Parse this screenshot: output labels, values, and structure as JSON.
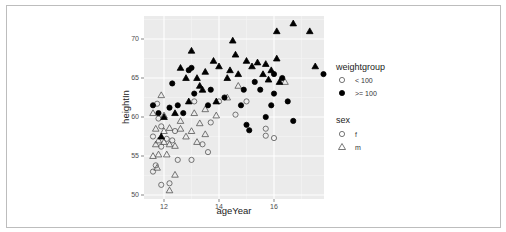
{
  "chart_data": {
    "type": "scatter",
    "title": "",
    "xlabel": "ageYear",
    "ylabel": "heightIn",
    "xlim": [
      11.3,
      17.8
    ],
    "ylim": [
      49.5,
      72.8
    ],
    "x_ticks": [
      12,
      14,
      16
    ],
    "y_ticks": [
      50,
      55,
      60,
      65,
      70
    ],
    "grid": true,
    "legend_position": "right",
    "legends": [
      {
        "title": "weightgroup",
        "aesthetic": "fill",
        "entries": [
          {
            "label": "< 100",
            "fill": "#ffffff"
          },
          {
            "label": ">= 100",
            "fill": "#000000"
          }
        ]
      },
      {
        "title": "sex",
        "aesthetic": "shape",
        "entries": [
          {
            "label": "f",
            "shape": "circle"
          },
          {
            "label": "m",
            "shape": "triangle"
          }
        ]
      }
    ],
    "points": [
      {
        "x": 11.6,
        "y": 53,
        "w": "<100",
        "s": "f"
      },
      {
        "x": 11.7,
        "y": 53.8,
        "w": "<100",
        "s": "f"
      },
      {
        "x": 11.75,
        "y": 53.5,
        "w": "<100",
        "s": "m"
      },
      {
        "x": 11.9,
        "y": 51.3,
        "w": "<100",
        "s": "f"
      },
      {
        "x": 12.2,
        "y": 51.5,
        "w": "<100",
        "s": "f"
      },
      {
        "x": 12.2,
        "y": 50.6,
        "w": "<100",
        "s": "m"
      },
      {
        "x": 12.4,
        "y": 52.6,
        "w": "<100",
        "s": "m"
      },
      {
        "x": 12.5,
        "y": 54.5,
        "w": "<100",
        "s": "f"
      },
      {
        "x": 13.0,
        "y": 54.5,
        "w": "<100",
        "s": "f"
      },
      {
        "x": 11.6,
        "y": 55,
        "w": "<100",
        "s": "m"
      },
      {
        "x": 11.8,
        "y": 55.2,
        "w": "<100",
        "s": "m"
      },
      {
        "x": 12.1,
        "y": 55.2,
        "w": "<100",
        "s": "m"
      },
      {
        "x": 11.6,
        "y": 57.5,
        "w": "<100",
        "s": "f"
      },
      {
        "x": 11.7,
        "y": 56.5,
        "w": "<100",
        "s": "m"
      },
      {
        "x": 11.8,
        "y": 57,
        "w": "<100",
        "s": "m"
      },
      {
        "x": 11.9,
        "y": 56.2,
        "w": "<100",
        "s": "f"
      },
      {
        "x": 12.0,
        "y": 56.8,
        "w": "<100",
        "s": "m"
      },
      {
        "x": 12.1,
        "y": 57.2,
        "w": "<100",
        "s": "f"
      },
      {
        "x": 12.2,
        "y": 56.5,
        "w": "<100",
        "s": "m"
      },
      {
        "x": 12.3,
        "y": 57,
        "w": "<100",
        "s": "f"
      },
      {
        "x": 12.4,
        "y": 56.3,
        "w": "<100",
        "s": "m"
      },
      {
        "x": 11.7,
        "y": 58.5,
        "w": "<100",
        "s": "m"
      },
      {
        "x": 11.9,
        "y": 58.8,
        "w": "<100",
        "s": "f"
      },
      {
        "x": 12.0,
        "y": 58.2,
        "w": "<100",
        "s": "m"
      },
      {
        "x": 12.2,
        "y": 58.6,
        "w": "<100",
        "s": "m"
      },
      {
        "x": 12.4,
        "y": 58.2,
        "w": "<100",
        "s": "f"
      },
      {
        "x": 12.6,
        "y": 58.5,
        "w": "<100",
        "s": "m"
      },
      {
        "x": 12.8,
        "y": 57.5,
        "w": "<100",
        "s": "m"
      },
      {
        "x": 13.0,
        "y": 58.2,
        "w": "<100",
        "s": "m"
      },
      {
        "x": 13.2,
        "y": 56.8,
        "w": "<100",
        "s": "m"
      },
      {
        "x": 13.4,
        "y": 56.5,
        "w": "<100",
        "s": "f"
      },
      {
        "x": 13.5,
        "y": 57.8,
        "w": "<100",
        "s": "m"
      },
      {
        "x": 13.6,
        "y": 55.5,
        "w": "<100",
        "s": "f"
      },
      {
        "x": 11.6,
        "y": 60.5,
        "w": "<100",
        "s": "m"
      },
      {
        "x": 11.8,
        "y": 59.8,
        "w": "<100",
        "s": "f"
      },
      {
        "x": 12.0,
        "y": 60.2,
        "w": "<100",
        "s": "m"
      },
      {
        "x": 11.9,
        "y": 62.8,
        "w": "<100",
        "s": "m"
      },
      {
        "x": 11.75,
        "y": 61.7,
        "w": "<100",
        "s": "f"
      },
      {
        "x": 12.6,
        "y": 59.5,
        "w": "<100",
        "s": "m"
      },
      {
        "x": 13.1,
        "y": 60.5,
        "w": "<100",
        "s": "m"
      },
      {
        "x": 13.3,
        "y": 59.2,
        "w": "<100",
        "s": "m"
      },
      {
        "x": 13.1,
        "y": 62,
        "w": "<100",
        "s": "f"
      },
      {
        "x": 13.5,
        "y": 61,
        "w": "<100",
        "s": "m"
      },
      {
        "x": 13.7,
        "y": 59.3,
        "w": "<100",
        "s": "f"
      },
      {
        "x": 13.9,
        "y": 60.2,
        "w": "<100",
        "s": "m"
      },
      {
        "x": 14.0,
        "y": 62,
        "w": "<100",
        "s": "f"
      },
      {
        "x": 14.3,
        "y": 62.5,
        "w": "<100",
        "s": "m"
      },
      {
        "x": 14.6,
        "y": 60.3,
        "w": "<100",
        "s": "f"
      },
      {
        "x": 14.7,
        "y": 64,
        "w": "<100",
        "s": "m"
      },
      {
        "x": 15.0,
        "y": 62,
        "w": "<100",
        "s": "f"
      },
      {
        "x": 15.7,
        "y": 58.5,
        "w": "<100",
        "s": "f"
      },
      {
        "x": 15.7,
        "y": 57.6,
        "w": "<100",
        "s": "f"
      },
      {
        "x": 16.0,
        "y": 57.3,
        "w": "<100",
        "s": "f"
      },
      {
        "x": 16.4,
        "y": 64.5,
        "w": "<100",
        "s": "m"
      },
      {
        "x": 11.6,
        "y": 61.5,
        "w": ">=100",
        "s": "f"
      },
      {
        "x": 11.8,
        "y": 60.5,
        "w": ">=100",
        "s": "f"
      },
      {
        "x": 11.9,
        "y": 57.5,
        "w": ">=100",
        "s": "m"
      },
      {
        "x": 12.0,
        "y": 60,
        "w": ">=100",
        "s": "m"
      },
      {
        "x": 12.2,
        "y": 61.2,
        "w": ">=100",
        "s": "f"
      },
      {
        "x": 12.3,
        "y": 64.3,
        "w": ">=100",
        "s": "f"
      },
      {
        "x": 12.4,
        "y": 60.5,
        "w": ">=100",
        "s": "m"
      },
      {
        "x": 12.5,
        "y": 61.5,
        "w": ">=100",
        "s": "f"
      },
      {
        "x": 12.6,
        "y": 66.3,
        "w": ">=100",
        "s": "m"
      },
      {
        "x": 12.7,
        "y": 60.5,
        "w": ">=100",
        "s": "f"
      },
      {
        "x": 12.8,
        "y": 65,
        "w": ">=100",
        "s": "m"
      },
      {
        "x": 12.9,
        "y": 66,
        "w": ">=100",
        "s": "f"
      },
      {
        "x": 12.9,
        "y": 62,
        "w": ">=100",
        "s": "m"
      },
      {
        "x": 13.0,
        "y": 68.5,
        "w": ">=100",
        "s": "m"
      },
      {
        "x": 13.0,
        "y": 66.3,
        "w": ">=100",
        "s": "f"
      },
      {
        "x": 13.1,
        "y": 63,
        "w": ">=100",
        "s": "f"
      },
      {
        "x": 13.2,
        "y": 65,
        "w": ">=100",
        "s": "m"
      },
      {
        "x": 13.3,
        "y": 64,
        "w": ">=100",
        "s": "m"
      },
      {
        "x": 13.4,
        "y": 63.5,
        "w": ">=100",
        "s": "m"
      },
      {
        "x": 13.5,
        "y": 65.8,
        "w": ">=100",
        "s": "m"
      },
      {
        "x": 13.6,
        "y": 61.5,
        "w": ">=100",
        "s": "f"
      },
      {
        "x": 13.7,
        "y": 63.5,
        "w": ">=100",
        "s": "f"
      },
      {
        "x": 13.8,
        "y": 67.2,
        "w": ">=100",
        "s": "m"
      },
      {
        "x": 13.9,
        "y": 62,
        "w": ">=100",
        "s": "m"
      },
      {
        "x": 14.0,
        "y": 66.5,
        "w": ">=100",
        "s": "m"
      },
      {
        "x": 14.2,
        "y": 62.5,
        "w": ">=100",
        "s": "f"
      },
      {
        "x": 14.3,
        "y": 65,
        "w": ">=100",
        "s": "m"
      },
      {
        "x": 14.4,
        "y": 66,
        "w": ">=100",
        "s": "m"
      },
      {
        "x": 14.5,
        "y": 69.8,
        "w": ">=100",
        "s": "m"
      },
      {
        "x": 14.6,
        "y": 68,
        "w": ">=100",
        "s": "m"
      },
      {
        "x": 14.7,
        "y": 65.5,
        "w": ">=100",
        "s": "m"
      },
      {
        "x": 14.8,
        "y": 61.5,
        "w": ">=100",
        "s": "f"
      },
      {
        "x": 14.9,
        "y": 63.5,
        "w": ">=100",
        "s": "f"
      },
      {
        "x": 15.0,
        "y": 67.2,
        "w": ">=100",
        "s": "m"
      },
      {
        "x": 15.0,
        "y": 59,
        "w": ">=100",
        "s": "f"
      },
      {
        "x": 15.1,
        "y": 58.3,
        "w": ">=100",
        "s": "f"
      },
      {
        "x": 15.2,
        "y": 66.5,
        "w": ">=100",
        "s": "m"
      },
      {
        "x": 15.3,
        "y": 64.5,
        "w": ">=100",
        "s": "f"
      },
      {
        "x": 15.4,
        "y": 67,
        "w": ">=100",
        "s": "m"
      },
      {
        "x": 15.5,
        "y": 63.5,
        "w": ">=100",
        "s": "f"
      },
      {
        "x": 15.6,
        "y": 65.5,
        "w": ">=100",
        "s": "m"
      },
      {
        "x": 15.7,
        "y": 66.8,
        "w": ">=100",
        "s": "m"
      },
      {
        "x": 15.7,
        "y": 60,
        "w": ">=100",
        "s": "f"
      },
      {
        "x": 15.8,
        "y": 64.8,
        "w": ">=100",
        "s": "m"
      },
      {
        "x": 15.9,
        "y": 66,
        "w": ">=100",
        "s": "m"
      },
      {
        "x": 15.9,
        "y": 61.5,
        "w": ">=100",
        "s": "f"
      },
      {
        "x": 16.0,
        "y": 63,
        "w": ">=100",
        "s": "f"
      },
      {
        "x": 16.0,
        "y": 65.5,
        "w": ">=100",
        "s": "f"
      },
      {
        "x": 16.1,
        "y": 71,
        "w": ">=100",
        "s": "m"
      },
      {
        "x": 16.1,
        "y": 67.5,
        "w": ">=100",
        "s": "m"
      },
      {
        "x": 16.2,
        "y": 64.5,
        "w": ">=100",
        "s": "m"
      },
      {
        "x": 16.3,
        "y": 65,
        "w": ">=100",
        "s": "f"
      },
      {
        "x": 16.5,
        "y": 62,
        "w": ">=100",
        "s": "f"
      },
      {
        "x": 16.7,
        "y": 72,
        "w": ">=100",
        "s": "m"
      },
      {
        "x": 16.7,
        "y": 59.5,
        "w": ">=100",
        "s": "f"
      },
      {
        "x": 17.3,
        "y": 71,
        "w": ">=100",
        "s": "m"
      },
      {
        "x": 17.5,
        "y": 66.5,
        "w": ">=100",
        "s": "m"
      },
      {
        "x": 17.8,
        "y": 65.5,
        "w": ">=100",
        "s": "f"
      },
      {
        "x": 18.0,
        "y": 69.5,
        "w": ">=100",
        "s": "m"
      },
      {
        "x": 18.0,
        "y": 68.8,
        "w": ">=100",
        "s": "m"
      },
      {
        "x": 18.3,
        "y": 65,
        "w": ">=100",
        "s": "f"
      },
      {
        "x": 18.3,
        "y": 62,
        "w": ">=100",
        "s": "f"
      }
    ]
  }
}
